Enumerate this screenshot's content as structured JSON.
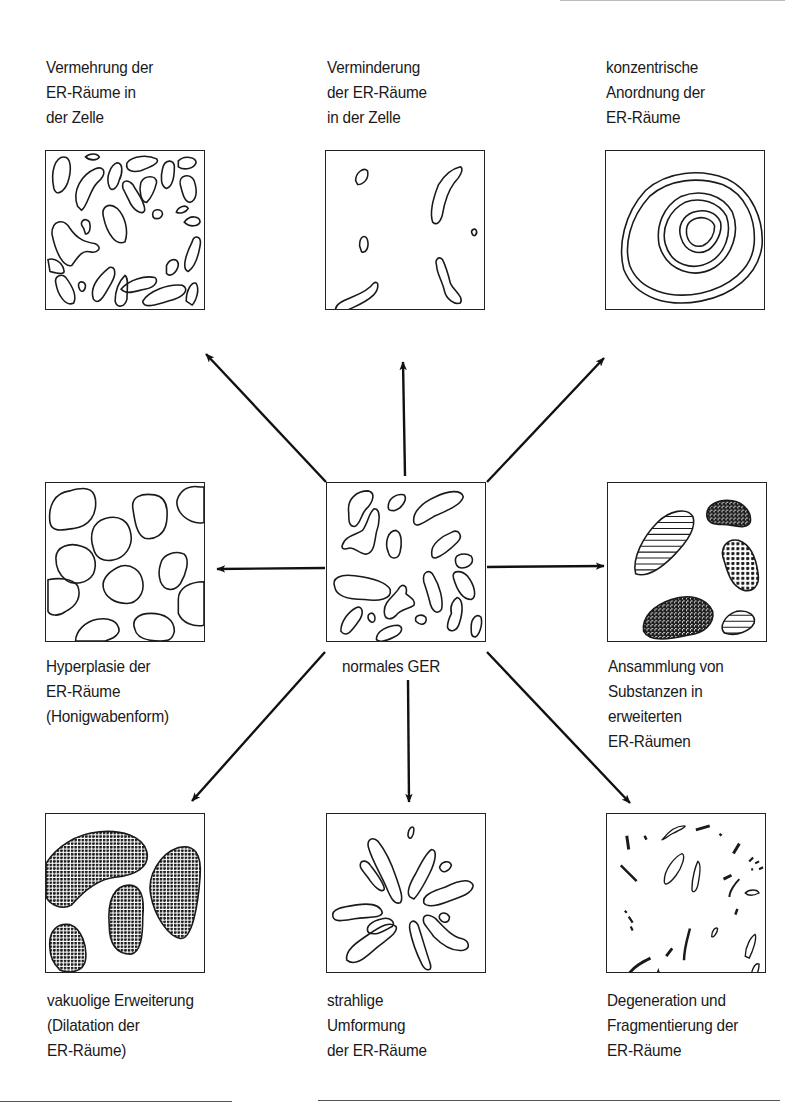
{
  "diagram": {
    "center": {
      "id": "normal",
      "label_lines": [
        "normales GER"
      ]
    },
    "panels": [
      {
        "id": "increase",
        "position": "top-left",
        "label_lines": [
          "Vermehrung der",
          "ER-Räume in",
          "der Zelle"
        ]
      },
      {
        "id": "decrease",
        "position": "top-center",
        "label_lines": [
          "Verminderung",
          "der ER-Räume",
          "in der Zelle"
        ]
      },
      {
        "id": "concentric",
        "position": "top-right",
        "label_lines": [
          "konzentrische",
          "Anordnung der",
          "ER-Räume"
        ]
      },
      {
        "id": "hyperplasia",
        "position": "middle-left",
        "label_lines": [
          "Hyperplasie der",
          "ER-Räume",
          "(Honigwabenform)"
        ]
      },
      {
        "id": "accumulation",
        "position": "middle-right",
        "label_lines": [
          "Ansammlung von",
          "Substanzen in",
          "erweiterten",
          "ER-Räumen"
        ]
      },
      {
        "id": "dilatation",
        "position": "bottom-left",
        "label_lines": [
          "vakuolige Erweiterung",
          "(Dilatation der",
          "ER-Räume)"
        ]
      },
      {
        "id": "radial",
        "position": "bottom-center",
        "label_lines": [
          "strahlige",
          "Umformung",
          "der ER-Räume"
        ]
      },
      {
        "id": "degeneration",
        "position": "bottom-right",
        "label_lines": [
          "Degeneration und",
          "Fragmentierung der",
          "ER-Räume"
        ]
      }
    ],
    "arrows": [
      {
        "from": "normal",
        "to": "increase"
      },
      {
        "from": "normal",
        "to": "decrease"
      },
      {
        "from": "normal",
        "to": "concentric"
      },
      {
        "from": "normal",
        "to": "hyperplasia"
      },
      {
        "from": "normal",
        "to": "accumulation"
      },
      {
        "from": "normal",
        "to": "dilatation"
      },
      {
        "from": "normal",
        "to": "radial"
      },
      {
        "from": "normal",
        "to": "degeneration"
      }
    ],
    "colors": {
      "ink": "#1a1a1a",
      "background": "#ffffff"
    }
  }
}
